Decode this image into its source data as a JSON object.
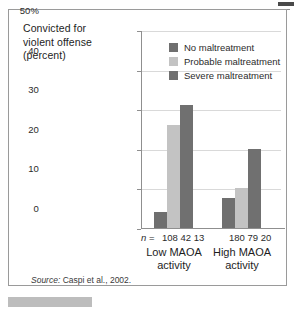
{
  "axis_title": {
    "line1": "Convicted for",
    "line2": "violent offense",
    "line3": "(percent)"
  },
  "source": {
    "label": "Source:",
    "text": "Caspi et al., 2002."
  },
  "n_row": {
    "prefix_italic": "n",
    "prefix_rest": " =",
    "groups": [
      "108 42 13",
      "180 79 20"
    ]
  },
  "chart_data": {
    "type": "bar",
    "title": "Convicted for violent offense (percent)",
    "xlabel": "",
    "ylabel": "Convicted for violent offense (percent)",
    "ylim": [
      0,
      50
    ],
    "yticks": [
      0,
      10,
      20,
      30,
      40,
      50
    ],
    "ytick_labels": [
      "0",
      "10",
      "20",
      "30",
      "40",
      "50%"
    ],
    "grid": true,
    "legend_position": "top-right-inside",
    "categories": [
      "Low MAOA activity",
      "High MAOA activity"
    ],
    "category_lines": [
      [
        "Low MAOA",
        "activity"
      ],
      [
        "High MAOA",
        "activity"
      ]
    ],
    "series": [
      {
        "name": "No maltreatment",
        "color": "#6f6f6f",
        "values": [
          4,
          7.5
        ],
        "n": [
          108,
          180
        ]
      },
      {
        "name": "Probable maltreatment",
        "color": "#c3c3c3",
        "values": [
          26,
          10.2
        ],
        "n": [
          42,
          79
        ]
      },
      {
        "name": "Severe maltreatment",
        "color": "#707070",
        "values": [
          31,
          20
        ],
        "n": [
          13,
          20
        ]
      }
    ],
    "source": "Source: Caspi et al., 2002."
  }
}
